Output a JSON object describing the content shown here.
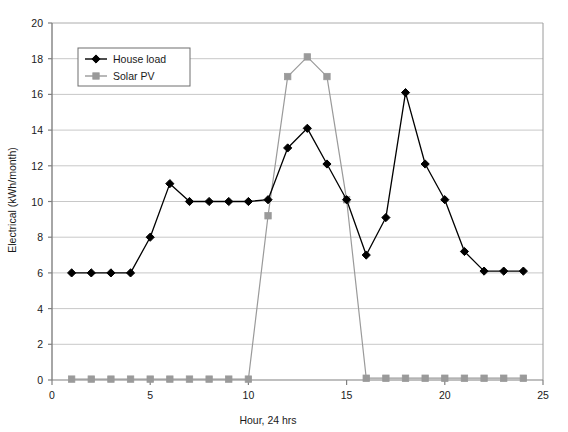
{
  "chart_data": {
    "type": "line",
    "title": "",
    "xlabel": "Hour, 24 hrs",
    "ylabel": "Electrical (kWh/month)",
    "xlim": [
      0,
      25
    ],
    "ylim": [
      0,
      20
    ],
    "xticks": [
      0,
      5,
      10,
      15,
      20,
      25
    ],
    "yticks": [
      0,
      2,
      4,
      6,
      8,
      10,
      12,
      14,
      16,
      18,
      20
    ],
    "grid": "horizontal",
    "legend_position": "upper-left-inside",
    "x": [
      1,
      2,
      3,
      4,
      5,
      6,
      7,
      8,
      9,
      10,
      11,
      12,
      13,
      14,
      15,
      16,
      17,
      18,
      19,
      20,
      21,
      22,
      23,
      24
    ],
    "series": [
      {
        "name": "House load",
        "color": "#000000",
        "marker": "diamond",
        "values": [
          6.0,
          6.0,
          6.0,
          6.0,
          8.0,
          11.0,
          10.0,
          10.0,
          10.0,
          10.0,
          10.1,
          13.0,
          14.1,
          12.1,
          10.1,
          7.0,
          9.1,
          16.1,
          12.1,
          10.1,
          7.2,
          6.1,
          6.1,
          6.1
        ]
      },
      {
        "name": "Solar PV",
        "color": "#9a9a9a",
        "marker": "square",
        "values": [
          0.05,
          0.05,
          0.05,
          0.05,
          0.05,
          0.05,
          0.05,
          0.05,
          0.05,
          0.05,
          9.2,
          17.0,
          18.1,
          17.0,
          10.1,
          0.1,
          0.1,
          0.1,
          0.1,
          0.1,
          0.1,
          0.1,
          0.1,
          0.1
        ]
      }
    ]
  },
  "axes": {
    "y_label": "Electrical (kWh/month)",
    "x_label": "Hour, 24 hrs",
    "y_tick_labels": [
      "0",
      "2",
      "4",
      "6",
      "8",
      "10",
      "12",
      "14",
      "16",
      "18",
      "20"
    ],
    "x_tick_labels": [
      "0",
      "5",
      "10",
      "15",
      "20",
      "25"
    ]
  },
  "legend": {
    "items": [
      {
        "label": "House load",
        "color": "#000000",
        "marker": "diamond"
      },
      {
        "label": "Solar PV",
        "color": "#9a9a9a",
        "marker": "square"
      }
    ]
  },
  "colors": {
    "house_load": "#000000",
    "solar_pv": "#9a9a9a",
    "gridline": "#c8c8c8",
    "axis": "#808080",
    "plot_border": "#9a9a9a",
    "background": "#ffffff"
  }
}
